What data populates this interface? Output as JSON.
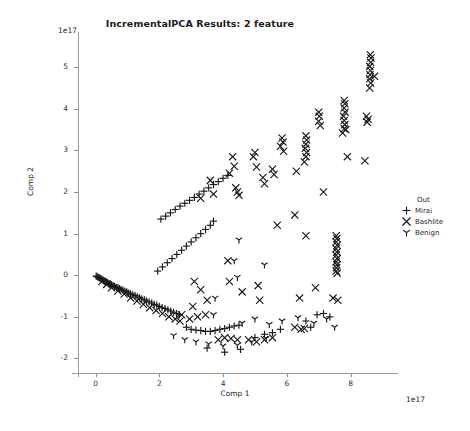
{
  "chart_data": {
    "type": "scatter",
    "title": "IncrementalPCA Results: 2 feature",
    "xlabel": "Comp 1",
    "ylabel": "Comp 2",
    "x_offset_text": "1e17",
    "y_offset_text": "1e17",
    "xlim": [
      -0.55,
      9.3
    ],
    "ylim": [
      -2.35,
      5.75
    ],
    "xticks": [
      0,
      2,
      4,
      6,
      8
    ],
    "yticks": [
      -2,
      -1,
      0,
      1,
      2,
      3,
      4,
      5
    ],
    "xtick_labels": [
      "0",
      "2",
      "4",
      "6",
      "8"
    ],
    "ytick_labels": [
      "-2",
      "-1",
      "0",
      "1",
      "2",
      "3",
      "4",
      "5"
    ],
    "grid": false,
    "legend_position": "right",
    "legend_title": "Out",
    "series": [
      {
        "name": "Mirai",
        "marker": "plus",
        "color": "#1a1a1a",
        "points": [
          [
            0.02,
            -0.02
          ],
          [
            0.05,
            -0.03
          ],
          [
            0.08,
            -0.05
          ],
          [
            0.11,
            -0.06
          ],
          [
            0.14,
            -0.07
          ],
          [
            0.17,
            -0.09
          ],
          [
            0.2,
            -0.1
          ],
          [
            0.23,
            -0.12
          ],
          [
            0.26,
            -0.13
          ],
          [
            0.3,
            -0.15
          ],
          [
            0.34,
            -0.16
          ],
          [
            0.38,
            -0.18
          ],
          [
            0.42,
            -0.2
          ],
          [
            0.46,
            -0.21
          ],
          [
            0.5,
            -0.23
          ],
          [
            0.55,
            -0.25
          ],
          [
            0.6,
            -0.27
          ],
          [
            0.65,
            -0.29
          ],
          [
            0.7,
            -0.3
          ],
          [
            0.75,
            -0.32
          ],
          [
            0.8,
            -0.34
          ],
          [
            0.86,
            -0.36
          ],
          [
            0.92,
            -0.38
          ],
          [
            0.98,
            -0.4
          ],
          [
            1.04,
            -0.43
          ],
          [
            1.1,
            -0.45
          ],
          [
            1.17,
            -0.47
          ],
          [
            1.24,
            -0.49
          ],
          [
            1.31,
            -0.52
          ],
          [
            1.38,
            -0.54
          ],
          [
            1.45,
            -0.57
          ],
          [
            1.53,
            -0.59
          ],
          [
            1.6,
            -0.62
          ],
          [
            1.68,
            -0.64
          ],
          [
            1.76,
            -0.67
          ],
          [
            1.84,
            -0.7
          ],
          [
            1.92,
            -0.72
          ],
          [
            2.0,
            -0.75
          ],
          [
            2.09,
            -0.78
          ],
          [
            2.18,
            -0.8
          ],
          [
            2.27,
            -0.83
          ],
          [
            2.36,
            -0.86
          ],
          [
            2.45,
            -0.89
          ],
          [
            2.54,
            -0.92
          ],
          [
            2.63,
            -0.95
          ],
          [
            2.05,
            1.35
          ],
          [
            2.2,
            1.42
          ],
          [
            2.35,
            1.5
          ],
          [
            2.5,
            1.58
          ],
          [
            2.65,
            1.66
          ],
          [
            2.8,
            1.73
          ],
          [
            2.95,
            1.8
          ],
          [
            3.1,
            1.87
          ],
          [
            3.25,
            1.95
          ],
          [
            3.4,
            2.02
          ],
          [
            3.55,
            2.1
          ],
          [
            3.7,
            2.18
          ],
          [
            3.85,
            2.25
          ],
          [
            4.0,
            2.33
          ],
          [
            4.15,
            2.4
          ],
          [
            1.95,
            0.1
          ],
          [
            2.1,
            0.2
          ],
          [
            2.25,
            0.3
          ],
          [
            2.4,
            0.4
          ],
          [
            2.55,
            0.5
          ],
          [
            2.7,
            0.6
          ],
          [
            2.85,
            0.7
          ],
          [
            3.0,
            0.8
          ],
          [
            3.15,
            0.9
          ],
          [
            3.3,
            1.0
          ],
          [
            3.45,
            1.1
          ],
          [
            3.6,
            1.2
          ],
          [
            3.7,
            1.3
          ],
          [
            2.85,
            -1.25
          ],
          [
            3.0,
            -1.3
          ],
          [
            3.15,
            -1.32
          ],
          [
            3.3,
            -1.33
          ],
          [
            3.45,
            -1.35
          ],
          [
            3.6,
            -1.35
          ],
          [
            3.75,
            -1.33
          ],
          [
            3.9,
            -1.3
          ],
          [
            4.05,
            -1.28
          ],
          [
            4.2,
            -1.25
          ],
          [
            4.35,
            -1.22
          ],
          [
            4.5,
            -1.2
          ],
          [
            3.5,
            -1.75
          ],
          [
            4.05,
            -1.85
          ],
          [
            4.55,
            -1.78
          ],
          [
            5.0,
            -1.5
          ],
          [
            5.3,
            -1.42
          ],
          [
            5.55,
            -1.38
          ],
          [
            5.8,
            -1.3
          ],
          [
            6.95,
            -0.95
          ],
          [
            7.15,
            -0.92
          ],
          [
            7.35,
            -1.0
          ],
          [
            6.6,
            -1.1
          ],
          [
            6.75,
            -1.25
          ]
        ]
      },
      {
        "name": "Bashlite",
        "marker": "x",
        "color": "#1a1a1a",
        "points": [
          [
            8.62,
            5.3
          ],
          [
            8.64,
            5.22
          ],
          [
            8.63,
            5.12
          ],
          [
            8.6,
            5.02
          ],
          [
            8.62,
            4.92
          ],
          [
            8.61,
            4.82
          ],
          [
            8.6,
            4.72
          ],
          [
            8.63,
            4.62
          ],
          [
            8.6,
            4.5
          ],
          [
            8.75,
            4.78
          ],
          [
            8.5,
            3.82
          ],
          [
            8.55,
            3.75
          ],
          [
            8.52,
            3.68
          ],
          [
            7.8,
            4.2
          ],
          [
            7.82,
            4.12
          ],
          [
            7.8,
            4.02
          ],
          [
            7.83,
            3.92
          ],
          [
            7.78,
            3.82
          ],
          [
            7.8,
            3.72
          ],
          [
            7.82,
            3.62
          ],
          [
            7.8,
            3.52
          ],
          [
            7.75,
            3.42
          ],
          [
            7.85,
            3.5
          ],
          [
            7.0,
            3.92
          ],
          [
            7.02,
            3.82
          ],
          [
            7.0,
            3.7
          ],
          [
            7.05,
            3.6
          ],
          [
            6.6,
            3.35
          ],
          [
            6.62,
            3.25
          ],
          [
            6.6,
            3.15
          ],
          [
            6.58,
            3.05
          ],
          [
            6.62,
            2.95
          ],
          [
            6.6,
            2.85
          ],
          [
            6.55,
            2.72
          ],
          [
            5.85,
            3.3
          ],
          [
            5.88,
            3.2
          ],
          [
            5.8,
            3.1
          ],
          [
            5.9,
            2.98
          ],
          [
            5.0,
            2.95
          ],
          [
            4.95,
            2.85
          ],
          [
            5.05,
            2.6
          ],
          [
            4.3,
            2.85
          ],
          [
            4.35,
            2.62
          ],
          [
            4.2,
            2.45
          ],
          [
            5.25,
            2.35
          ],
          [
            5.3,
            2.2
          ],
          [
            5.55,
            2.55
          ],
          [
            5.6,
            2.42
          ],
          [
            4.4,
            2.1
          ],
          [
            4.45,
            2.0
          ],
          [
            4.5,
            1.92
          ],
          [
            3.6,
            2.28
          ],
          [
            3.7,
            1.95
          ],
          [
            3.3,
            1.85
          ],
          [
            6.3,
            2.5
          ],
          [
            7.15,
            2.0
          ],
          [
            7.9,
            2.85
          ],
          [
            8.45,
            2.75
          ],
          [
            5.7,
            1.2
          ],
          [
            6.25,
            1.45
          ],
          [
            6.6,
            0.95
          ],
          [
            7.55,
            0.95
          ],
          [
            7.57,
            0.88
          ],
          [
            7.55,
            0.8
          ],
          [
            7.58,
            0.72
          ],
          [
            7.55,
            0.64
          ],
          [
            7.57,
            0.56
          ],
          [
            7.55,
            0.48
          ],
          [
            7.58,
            0.4
          ],
          [
            7.55,
            0.32
          ],
          [
            7.57,
            0.25
          ],
          [
            7.56,
            0.18
          ],
          [
            7.55,
            0.1
          ],
          [
            7.58,
            0.05
          ],
          [
            4.15,
            0.35
          ],
          [
            4.2,
            -0.15
          ],
          [
            4.6,
            -0.4
          ],
          [
            5.1,
            -0.25
          ],
          [
            5.15,
            -0.6
          ],
          [
            6.4,
            -0.55
          ],
          [
            6.9,
            -0.3
          ],
          [
            7.45,
            -0.55
          ],
          [
            7.6,
            -0.6
          ],
          [
            3.1,
            -0.15
          ],
          [
            3.3,
            -0.35
          ],
          [
            3.5,
            -0.6
          ],
          [
            3.05,
            -0.75
          ],
          [
            2.7,
            -0.95
          ],
          [
            2.95,
            -1.05
          ],
          [
            3.2,
            -1.0
          ],
          [
            3.45,
            -0.95
          ],
          [
            6.25,
            -1.25
          ],
          [
            6.45,
            -1.3
          ],
          [
            6.55,
            -1.28
          ],
          [
            5.3,
            -1.55
          ],
          [
            5.55,
            -1.5
          ],
          [
            5.05,
            -1.6
          ],
          [
            4.8,
            -1.55
          ],
          [
            3.85,
            -1.55
          ],
          [
            4.05,
            -1.5
          ],
          [
            4.25,
            -1.52
          ],
          [
            4.45,
            -1.55
          ],
          [
            1.1,
            -0.55
          ],
          [
            1.3,
            -0.62
          ],
          [
            1.5,
            -0.7
          ],
          [
            1.7,
            -0.78
          ],
          [
            1.9,
            -0.85
          ],
          [
            2.1,
            -0.92
          ],
          [
            2.3,
            -1.0
          ],
          [
            2.5,
            -1.05
          ],
          [
            2.65,
            -1.1
          ],
          [
            0.9,
            -0.45
          ],
          [
            0.7,
            -0.38
          ],
          [
            0.5,
            -0.3
          ],
          [
            0.35,
            -0.22
          ],
          [
            0.2,
            -0.15
          ]
        ]
      },
      {
        "name": "Benign",
        "marker": "tri_down",
        "color": "#1a1a1a",
        "points": [
          [
            4.5,
            0.85
          ],
          [
            4.35,
            0.35
          ],
          [
            4.45,
            -0.05
          ],
          [
            5.3,
            0.25
          ],
          [
            3.75,
            -0.55
          ],
          [
            3.7,
            -0.95
          ],
          [
            4.6,
            -1.15
          ],
          [
            5.0,
            -1.05
          ],
          [
            5.45,
            -1.18
          ],
          [
            5.85,
            -1.1
          ],
          [
            6.35,
            -1.02
          ],
          [
            6.85,
            -1.15
          ],
          [
            7.25,
            -1.05
          ],
          [
            7.5,
            -1.25
          ],
          [
            2.45,
            -1.45
          ],
          [
            2.8,
            -1.55
          ],
          [
            3.15,
            -1.6
          ],
          [
            3.55,
            -1.65
          ],
          [
            4.0,
            -1.7
          ],
          [
            4.45,
            -1.68
          ],
          [
            4.9,
            -1.6
          ],
          [
            5.35,
            -1.52
          ]
        ]
      }
    ]
  }
}
